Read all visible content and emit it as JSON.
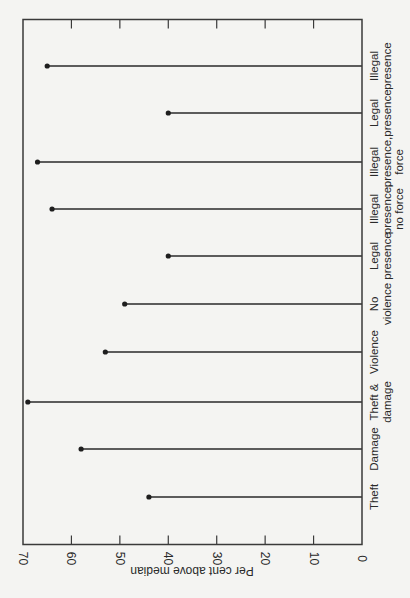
{
  "chart_data": {
    "type": "lollipop",
    "orientation": "rotated 90 degrees (page printed sideways)",
    "title": "",
    "xlabel": "",
    "ylabel": "Per cent above median",
    "ylim": [
      0,
      70
    ],
    "yticks": [
      0,
      10,
      20,
      30,
      40,
      50,
      60,
      70
    ],
    "grid": false,
    "legend": null,
    "categories": [
      [
        "Theft"
      ],
      [
        "Damage"
      ],
      [
        "Theft &",
        "damage"
      ],
      [
        "Violence"
      ],
      [
        "No",
        "violence"
      ],
      [
        "Legal",
        "presence"
      ],
      [
        "Illegal",
        "presence,",
        "no force"
      ],
      [
        "Illegal",
        "presence,",
        "force"
      ],
      [
        "Legal",
        "presence"
      ],
      [
        "Illegal",
        "presence"
      ]
    ],
    "category_names": [
      "Theft",
      "Damage",
      "Theft & damage",
      "Violence",
      "No violence",
      "Legal presence",
      "Illegal presence, no force",
      "Illegal presence, force",
      "Legal presence",
      "Illegal presence"
    ],
    "values": [
      44,
      58,
      69,
      53,
      49,
      40,
      64,
      67,
      40,
      65
    ]
  },
  "colors": {
    "background": "#f4f4f2",
    "ink": "#2a2a2a"
  }
}
